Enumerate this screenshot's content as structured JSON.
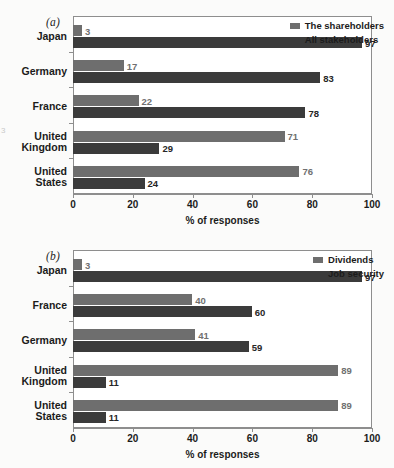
{
  "figure": {
    "background": "#fbfbfa",
    "margin_artifact": "3"
  },
  "colors": {
    "series_light": "#6e6e6e",
    "series_dark": "#3b3b3b",
    "frame": "#8e8e8e",
    "text": "#1b1b1b"
  },
  "panels": [
    {
      "id": "a",
      "label": "(a)",
      "xlabel": "% of responses",
      "xticks": [
        "0",
        "20",
        "40",
        "60",
        "80",
        "100"
      ],
      "legend": [
        {
          "label": "The shareholders",
          "color": "#6e6e6e"
        },
        {
          "label": "All stakeholders",
          "color": "#3b3b3b"
        }
      ],
      "categories": [
        {
          "lines": [
            "Japan"
          ]
        },
        {
          "lines": [
            "Germany"
          ]
        },
        {
          "lines": [
            "France"
          ]
        },
        {
          "lines": [
            "United",
            "Kingdom"
          ]
        },
        {
          "lines": [
            "United",
            "States"
          ]
        }
      ],
      "values_light": [
        3,
        17,
        22,
        71,
        76
      ],
      "values_dark": [
        97,
        83,
        78,
        29,
        24
      ],
      "labels_light": [
        "3",
        "17",
        "22",
        "71",
        "76"
      ],
      "labels_dark": [
        "97",
        "83",
        "78",
        "29",
        "24"
      ]
    },
    {
      "id": "b",
      "label": "(b)",
      "xlabel": "% of responses",
      "xticks": [
        "0",
        "20",
        "40",
        "60",
        "80",
        "100"
      ],
      "legend": [
        {
          "label": "Dividends",
          "color": "#6e6e6e"
        },
        {
          "label": "Job security",
          "color": "#3b3b3b"
        }
      ],
      "categories": [
        {
          "lines": [
            "Japan"
          ]
        },
        {
          "lines": [
            "France"
          ]
        },
        {
          "lines": [
            "Germany"
          ]
        },
        {
          "lines": [
            "United",
            "Kingdom"
          ]
        },
        {
          "lines": [
            "United",
            "States"
          ]
        }
      ],
      "values_light": [
        3,
        40,
        41,
        89,
        89
      ],
      "values_dark": [
        97,
        60,
        59,
        11,
        11
      ],
      "labels_light": [
        "3",
        "40",
        "41",
        "89",
        "89"
      ],
      "labels_dark": [
        "97",
        "60",
        "59",
        "11",
        "11"
      ]
    }
  ],
  "chart_data": [
    {
      "type": "bar",
      "orientation": "horizontal",
      "panel": "(a)",
      "title": "",
      "xlabel": "% of responses",
      "ylabel": "",
      "xlim": [
        0,
        100
      ],
      "xticks": [
        0,
        20,
        40,
        60,
        80,
        100
      ],
      "grid": false,
      "legend_position": "top-right",
      "categories": [
        "Japan",
        "Germany",
        "France",
        "United Kingdom",
        "United States"
      ],
      "series": [
        {
          "name": "The shareholders",
          "color": "#6e6e6e",
          "values": [
            3,
            17,
            22,
            71,
            76
          ]
        },
        {
          "name": "All stakeholders",
          "color": "#3b3b3b",
          "values": [
            97,
            83,
            78,
            29,
            24
          ]
        }
      ]
    },
    {
      "type": "bar",
      "orientation": "horizontal",
      "panel": "(b)",
      "title": "",
      "xlabel": "% of responses",
      "ylabel": "",
      "xlim": [
        0,
        100
      ],
      "xticks": [
        0,
        20,
        40,
        60,
        80,
        100
      ],
      "grid": false,
      "legend_position": "top-right",
      "categories": [
        "Japan",
        "France",
        "Germany",
        "United Kingdom",
        "United States"
      ],
      "series": [
        {
          "name": "Dividends",
          "color": "#6e6e6e",
          "values": [
            3,
            40,
            41,
            89,
            89
          ]
        },
        {
          "name": "Job security",
          "color": "#3b3b3b",
          "values": [
            97,
            60,
            59,
            11,
            11
          ]
        }
      ]
    }
  ]
}
